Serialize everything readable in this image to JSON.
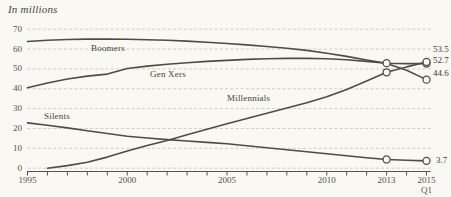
{
  "title": "In millions",
  "chart_data": {
    "type": "line",
    "title": "In millions",
    "xlabel": "",
    "ylabel": "",
    "ylim": [
      0,
      70
    ],
    "y_ticks": [
      0,
      10,
      20,
      30,
      40,
      50,
      60,
      70
    ],
    "x_range": [
      1995,
      2015
    ],
    "x_ticks": [
      {
        "year": 1995,
        "label": "1995"
      },
      {
        "year": 2000,
        "label": "2000"
      },
      {
        "year": 2005,
        "label": "2005"
      },
      {
        "year": 2010,
        "label": "2010"
      },
      {
        "year": 2013,
        "label": "2013"
      },
      {
        "year": 2015,
        "label": "2015",
        "sublabel": "Q1"
      }
    ],
    "grid": "horizontal-dashed",
    "legend_position": "labels-on-lines",
    "line_color": "#4f4c45",
    "grid_color": "#cbc8bf",
    "series": [
      {
        "name": "Boomers",
        "end_label": "44.6",
        "points": [
          [
            1995,
            63.8
          ],
          [
            1996,
            64.4
          ],
          [
            1997,
            64.8
          ],
          [
            1998,
            65.0
          ],
          [
            1999,
            65.0
          ],
          [
            2000,
            64.9
          ],
          [
            2001,
            64.7
          ],
          [
            2002,
            64.4
          ],
          [
            2003,
            64.0
          ],
          [
            2004,
            63.4
          ],
          [
            2005,
            62.8
          ],
          [
            2006,
            62.1
          ],
          [
            2007,
            61.3
          ],
          [
            2008,
            60.4
          ],
          [
            2009,
            59.3
          ],
          [
            2010,
            57.9
          ],
          [
            2011,
            56.3
          ],
          [
            2012,
            54.5
          ],
          [
            2013,
            52.8
          ],
          [
            2014,
            49.3
          ],
          [
            2015,
            44.6
          ]
        ],
        "markers": [
          [
            2015,
            44.6
          ]
        ]
      },
      {
        "name": "Gen Xers",
        "end_label": "52.7",
        "points": [
          [
            1995,
            40.5
          ],
          [
            1996,
            42.9
          ],
          [
            1997,
            44.9
          ],
          [
            1998,
            46.4
          ],
          [
            1999,
            47.4
          ],
          [
            2000,
            50.2
          ],
          [
            2001,
            51.4
          ],
          [
            2002,
            52.3
          ],
          [
            2003,
            53.1
          ],
          [
            2004,
            53.8
          ],
          [
            2005,
            54.3
          ],
          [
            2006,
            54.8
          ],
          [
            2007,
            55.1
          ],
          [
            2008,
            55.3
          ],
          [
            2009,
            55.3
          ],
          [
            2010,
            55.1
          ],
          [
            2011,
            54.6
          ],
          [
            2012,
            53.8
          ],
          [
            2013,
            52.9
          ],
          [
            2014,
            52.7
          ],
          [
            2015,
            52.7
          ]
        ],
        "markers": [
          [
            2013,
            52.9
          ],
          [
            2015,
            52.7
          ]
        ]
      },
      {
        "name": "Millennials",
        "end_label": "53.5",
        "points": [
          [
            1996,
            0
          ],
          [
            1997,
            1.3
          ],
          [
            1998,
            3.0
          ],
          [
            1999,
            5.6
          ],
          [
            2000,
            8.6
          ],
          [
            2001,
            11.4
          ],
          [
            2002,
            14.0
          ],
          [
            2003,
            16.8
          ],
          [
            2004,
            19.6
          ],
          [
            2005,
            22.4
          ],
          [
            2006,
            25.1
          ],
          [
            2007,
            27.7
          ],
          [
            2008,
            30.3
          ],
          [
            2009,
            33.0
          ],
          [
            2010,
            36.0
          ],
          [
            2011,
            39.7
          ],
          [
            2012,
            43.9
          ],
          [
            2013,
            48.3
          ],
          [
            2014,
            51.0
          ],
          [
            2015,
            53.5
          ]
        ],
        "markers": [
          [
            2013,
            48.3
          ],
          [
            2015,
            53.5
          ]
        ]
      },
      {
        "name": "Silents",
        "end_label": "3.7",
        "points": [
          [
            1995,
            22.8
          ],
          [
            1996,
            21.6
          ],
          [
            1997,
            20.3
          ],
          [
            1998,
            18.9
          ],
          [
            1999,
            17.5
          ],
          [
            2000,
            16.1
          ],
          [
            2001,
            15.2
          ],
          [
            2002,
            14.4
          ],
          [
            2003,
            13.7
          ],
          [
            2004,
            13.0
          ],
          [
            2005,
            12.3
          ],
          [
            2006,
            11.3
          ],
          [
            2007,
            10.3
          ],
          [
            2008,
            9.3
          ],
          [
            2009,
            8.3
          ],
          [
            2010,
            7.3
          ],
          [
            2011,
            6.3
          ],
          [
            2012,
            5.3
          ],
          [
            2013,
            4.4
          ],
          [
            2014,
            4.0
          ],
          [
            2015,
            3.7
          ]
        ],
        "markers": [
          [
            2013,
            4.4
          ],
          [
            2015,
            3.7
          ]
        ]
      }
    ]
  }
}
